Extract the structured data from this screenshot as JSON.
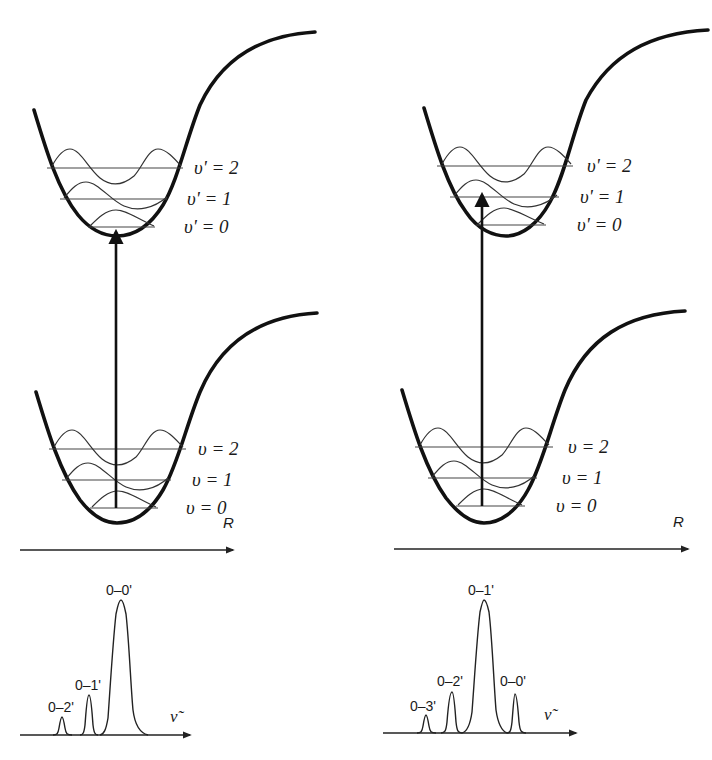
{
  "figure": {
    "panels": [
      {
        "id": "left",
        "transition": "0-0' dominant (vertical transition from v=0 hits v'=0)",
        "upper_state_labels": [
          "υ' = 2",
          "υ' = 1",
          "υ' = 0"
        ],
        "lower_state_labels": [
          "υ = 2",
          "υ = 1",
          "υ = 0"
        ],
        "axis_label": "R",
        "spectrum": {
          "axis_label": "ν̃",
          "peaks": [
            {
              "label": "0–2'",
              "relative_height": 0.13
            },
            {
              "label": "0–1'",
              "relative_height": 0.3
            },
            {
              "label": "0–0'",
              "relative_height": 1.0
            }
          ]
        }
      },
      {
        "id": "right",
        "transition": "0-1' dominant (upper potential displaced, vertical transition hits v'=1)",
        "upper_state_labels": [
          "υ' = 2",
          "υ' = 1",
          "υ' = 0"
        ],
        "lower_state_labels": [
          "υ = 2",
          "υ = 1",
          "υ = 0"
        ],
        "axis_label": "R",
        "spectrum": {
          "axis_label": "ν̃",
          "peaks": [
            {
              "label": "0–3'",
              "relative_height": 0.13
            },
            {
              "label": "0–2'",
              "relative_height": 0.3
            },
            {
              "label": "0–1'",
              "relative_height": 1.0
            },
            {
              "label": "0–0'",
              "relative_height": 0.31
            }
          ]
        }
      }
    ]
  },
  "labels": {
    "left_upper_v2": "υ' = 2",
    "left_upper_v1": "υ' = 1",
    "left_upper_v0": "υ' = 0",
    "left_lower_v2": "υ = 2",
    "left_lower_v1": "υ = 1",
    "left_lower_v0": "υ = 0",
    "right_upper_v2": "υ' = 2",
    "right_upper_v1": "υ' = 1",
    "right_upper_v0": "υ' = 0",
    "right_lower_v2": "υ = 2",
    "right_lower_v1": "υ = 1",
    "right_lower_v0": "υ = 0",
    "axis_r": "R",
    "axis_nu": "ν̃",
    "left_peak_02": "0–2'",
    "left_peak_01": "0–1'",
    "left_peak_00": "0–0'",
    "right_peak_03": "0–3'",
    "right_peak_02": "0–2'",
    "right_peak_01": "0–1'",
    "right_peak_00": "0–0'"
  },
  "colors": {
    "ink": "#111111",
    "background": "#ffffff"
  }
}
